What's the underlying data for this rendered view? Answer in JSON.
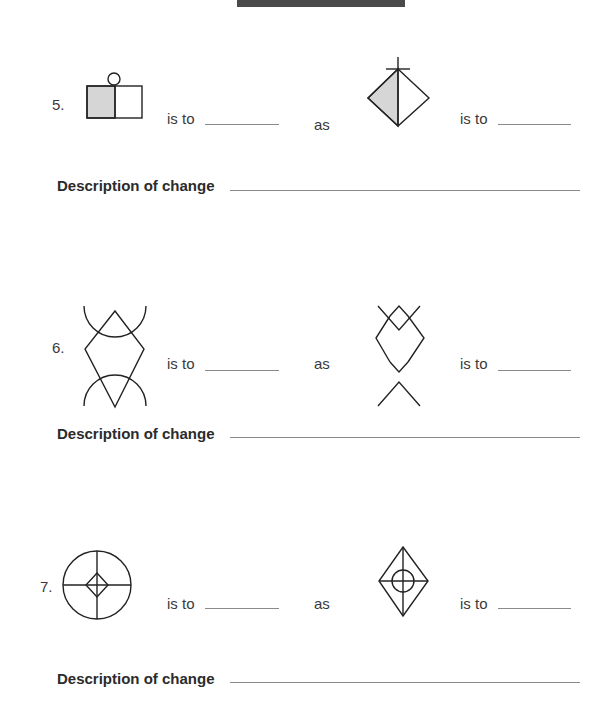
{
  "header": {
    "bar": "dark header bar"
  },
  "items": [
    {
      "number": "5.",
      "is_to_1": "is to",
      "as": "as",
      "is_to_2": "is to",
      "description_label": "Description of change",
      "figure_a": "square split vertically, left half shaded gray, small circle on top",
      "figure_b": "diamond split vertically, left half shaded gray, cross at top vertex"
    },
    {
      "number": "6.",
      "is_to_1": "is to",
      "as": "as",
      "is_to_2": "is to",
      "description_label": "Description of change",
      "figure_a": "diamond with arcs crossing top and bottom points",
      "figure_b": "diamond with X-shaped lines crossing top and bottom points"
    },
    {
      "number": "7.",
      "is_to_1": "is to",
      "as": "as",
      "is_to_2": "is to",
      "description_label": "Description of change",
      "figure_a": "circle with cross and small diamond in center",
      "figure_b": "diamond with cross and small circle in center"
    }
  ]
}
